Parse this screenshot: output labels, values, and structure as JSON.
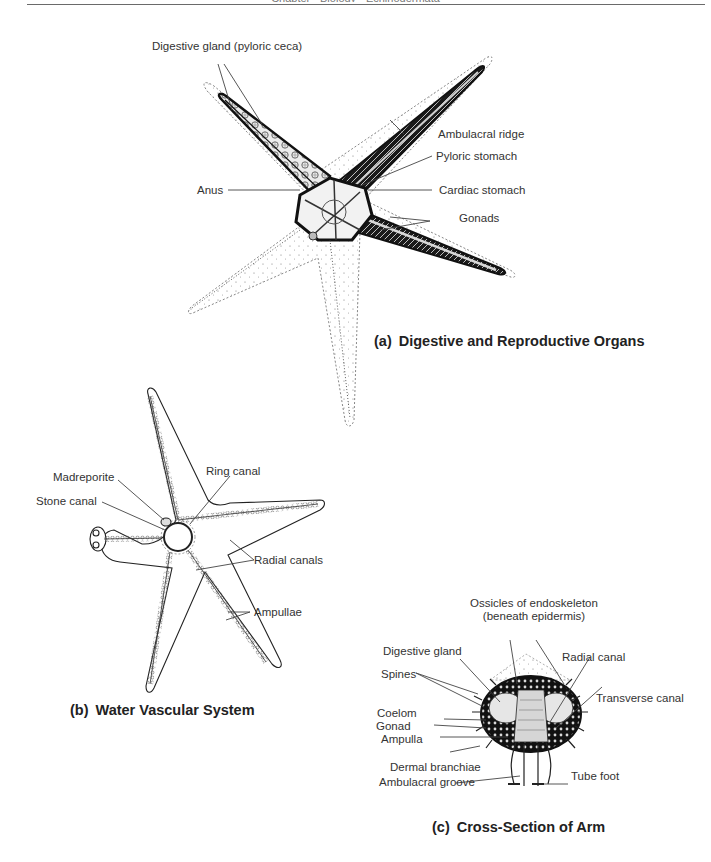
{
  "header": {
    "running_text": "Chapter  ·  Biology  ·  Echinodermata"
  },
  "panels": {
    "a": {
      "prefix": "(a)",
      "title": "Digestive and Reproductive Organs",
      "labels": {
        "digestive_gland": "Digestive gland (pyloric ceca)",
        "ambulacral_ridge": "Ambulacral ridge",
        "pyloric_stomach": "Pyloric stomach",
        "anus": "Anus",
        "cardiac_stomach": "Cardiac stomach",
        "gonads": "Gonads"
      }
    },
    "b": {
      "prefix": "(b)",
      "title": "Water Vascular System",
      "labels": {
        "madreporite": "Madreporite",
        "ring_canal": "Ring canal",
        "stone_canal": "Stone canal",
        "radial_canals": "Radial canals",
        "ampullae": "Ampullae"
      }
    },
    "c": {
      "prefix": "(c)",
      "title": "Cross-Section of Arm",
      "labels": {
        "ossicles_line1": "Ossicles of endoskeleton",
        "ossicles_line2": "(beneath epidermis)",
        "digestive_gland": "Digestive gland",
        "radial_canal": "Radial canal",
        "spines": "Spines",
        "transverse_canal": "Transverse canal",
        "coelom": "Coelom",
        "gonad": "Gonad",
        "ampulla": "Ampulla",
        "dermal_branchiae": "Dermal branchiae",
        "ambulacral_groove": "Ambulacral groove",
        "tube_foot": "Tube foot"
      }
    }
  },
  "colors": {
    "ink": "#1a1a1a",
    "label_text": "#333333",
    "leader_line": "#444444",
    "stipple": "#8a8a8a",
    "rule": "#6a6a6a"
  }
}
